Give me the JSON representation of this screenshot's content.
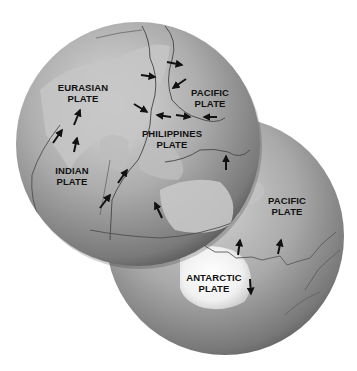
{
  "diagram": {
    "globes": [
      {
        "name": "asia-pacific-globe",
        "cx": 138,
        "cy": 144,
        "r": 122
      },
      {
        "name": "southern-pacific-globe",
        "cx": 225,
        "cy": 236,
        "r": 119
      }
    ],
    "labels": [
      {
        "id": "eurasian",
        "line1": "EURASIAN",
        "line2": "PLATE",
        "x": 83,
        "y": 82
      },
      {
        "id": "pacific-north",
        "line1": "PACIFIC",
        "line2": "PLATE",
        "x": 210,
        "y": 87
      },
      {
        "id": "philippines",
        "line1": "PHILIPPINES",
        "line2": "PLATE",
        "x": 172,
        "y": 128
      },
      {
        "id": "indian",
        "line1": "INDIAN",
        "line2": "PLATE",
        "x": 72,
        "y": 165
      },
      {
        "id": "pacific-south",
        "line1": "PACIFIC",
        "line2": "PLATE",
        "x": 287,
        "y": 195
      },
      {
        "id": "antarctic",
        "line1": "ANTARCTIC",
        "line2": "PLATE",
        "x": 214,
        "y": 272
      }
    ],
    "arrows": [
      {
        "x1": 167,
        "y1": 62,
        "x2": 182,
        "y2": 65
      },
      {
        "x1": 141,
        "y1": 75,
        "x2": 155,
        "y2": 77
      },
      {
        "x1": 186,
        "y1": 79,
        "x2": 173,
        "y2": 88
      },
      {
        "x1": 134,
        "y1": 104,
        "x2": 147,
        "y2": 112
      },
      {
        "x1": 171,
        "y1": 117,
        "x2": 157,
        "y2": 115
      },
      {
        "x1": 176,
        "y1": 115,
        "x2": 190,
        "y2": 117
      },
      {
        "x1": 217,
        "y1": 117,
        "x2": 204,
        "y2": 117
      },
      {
        "x1": 74,
        "y1": 125,
        "x2": 80,
        "y2": 110
      },
      {
        "x1": 53,
        "y1": 143,
        "x2": 62,
        "y2": 130
      },
      {
        "x1": 74,
        "y1": 152,
        "x2": 77,
        "y2": 138
      },
      {
        "x1": 118,
        "y1": 183,
        "x2": 127,
        "y2": 170
      },
      {
        "x1": 100,
        "y1": 208,
        "x2": 110,
        "y2": 195
      },
      {
        "x1": 162,
        "y1": 218,
        "x2": 155,
        "y2": 203
      },
      {
        "x1": 226,
        "y1": 170,
        "x2": 226,
        "y2": 156
      },
      {
        "x1": 238,
        "y1": 255,
        "x2": 240,
        "y2": 240
      },
      {
        "x1": 278,
        "y1": 254,
        "x2": 281,
        "y2": 240
      },
      {
        "x1": 250,
        "y1": 279,
        "x2": 251,
        "y2": 294
      }
    ]
  }
}
